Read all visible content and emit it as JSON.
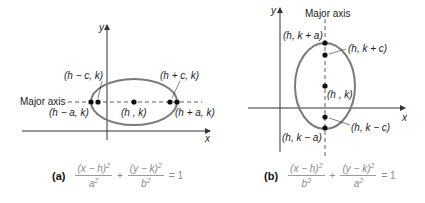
{
  "colors": {
    "ellipse": "#7a7a7a",
    "axes": "#333333",
    "points": "#111111",
    "equation_text": "#8a8a8a"
  },
  "panel_a": {
    "tag": "(a)",
    "axis_x": "x",
    "axis_y": "y",
    "major_axis_label": "Major axis",
    "orientation": "horizontal",
    "points": {
      "vertex_left": "(h − a, k)",
      "focus_left": "(h − c, k)",
      "center": "(h , k)",
      "focus_right": "(h + c, k)",
      "vertex_right": "(h + a, k)"
    },
    "equation": {
      "term1_num": "(x − h)",
      "term1_den": "a",
      "plus": "+",
      "term2_num": "(y − k)",
      "term2_den": "b",
      "exp": "2",
      "equals": "= 1"
    }
  },
  "panel_b": {
    "tag": "(b)",
    "axis_x": "x",
    "axis_y": "y",
    "major_axis_label": "Major axis",
    "orientation": "vertical",
    "points": {
      "vertex_top": "(h, k + a)",
      "focus_top": "(h, k + c)",
      "center": "(h , k)",
      "focus_bottom": "(h, k − c)",
      "vertex_bottom": "(h, k − a)"
    },
    "equation": {
      "term1_num": "(x − h)",
      "term1_den": "b",
      "plus": "+",
      "term2_num": "(y − k)",
      "term2_den": "a",
      "exp": "2",
      "equals": "= 1"
    }
  }
}
